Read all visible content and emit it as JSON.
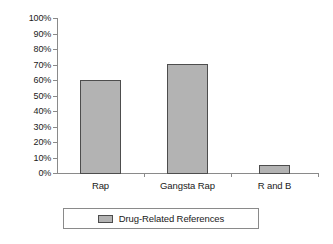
{
  "chart_data": {
    "type": "bar",
    "title": "",
    "subtitle": "",
    "xlabel": "",
    "ylabel": "",
    "categories": [
      "Rap",
      "Gangsta Rap",
      "R and B"
    ],
    "series": [
      {
        "name": "Drug-Related References",
        "values": [
          60,
          70.5,
          5
        ],
        "color": "#b3b3b3",
        "border_color": "#4d4d4d"
      }
    ],
    "ylim": [
      0,
      100
    ],
    "y_ticks": [
      0,
      10,
      20,
      30,
      40,
      50,
      60,
      70,
      80,
      90,
      100
    ],
    "y_tick_labels": [
      "0%",
      "10%",
      "20%",
      "30%",
      "40%",
      "50%",
      "60%",
      "70%",
      "80%",
      "90%",
      "100%"
    ],
    "value_suffix": "%",
    "grid": false,
    "legend": {
      "position": "bottom",
      "boxed": true,
      "entries": [
        {
          "label": "Drug-Related References",
          "swatch_color": "#b3b3b3"
        }
      ]
    },
    "axis_color": "#8a8a8a",
    "background": "#ffffff"
  }
}
